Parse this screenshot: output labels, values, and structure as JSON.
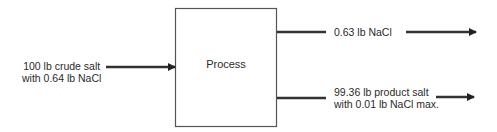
{
  "diagram": {
    "type": "process-flow",
    "process": {
      "label": "Process"
    },
    "input": {
      "line1": "100 lb crude salt",
      "line2": "with 0.64 lb NaCl"
    },
    "outputs": [
      {
        "line1": "0.63 lb NaCl",
        "line2": ""
      },
      {
        "line1": "99.36 lb product salt",
        "line2": "with 0.01 lb NaCl max."
      }
    ],
    "colors": {
      "stroke": "#333333",
      "box_border": "#555555",
      "text": "#2a2a2a"
    }
  }
}
